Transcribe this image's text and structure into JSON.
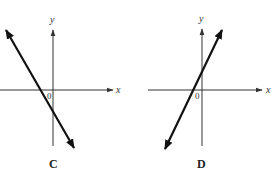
{
  "panels": [
    {
      "id": "C",
      "label": "C",
      "x_axis_label": "x",
      "y_axis_label": "y",
      "origin_label": "0",
      "line": {
        "slope_sign": "negative",
        "x_intercept": "negative",
        "y_intercept": "negative"
      }
    },
    {
      "id": "D",
      "label": "D",
      "x_axis_label": "x",
      "y_axis_label": "y",
      "origin_label": "0",
      "line": {
        "slope_sign": "positive",
        "x_intercept": "negative",
        "y_intercept": "positive"
      }
    }
  ],
  "colors": {
    "axis": "#333333",
    "line": "#111111",
    "background": "#ffffff"
  }
}
